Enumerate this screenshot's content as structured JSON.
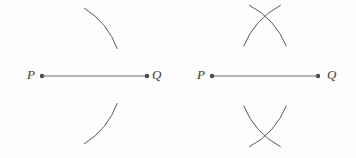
{
  "canvas": {
    "width": 356,
    "height": 158,
    "background_color": "#fdfdfd"
  },
  "style": {
    "stroke_color": "#5a5a5a",
    "segment_color": "#6b6b6b",
    "dot_color": "#4a4a4a",
    "label_color": "#3b3b3b",
    "stroke_width": 1,
    "dot_radius": 2.2
  },
  "figures": [
    {
      "id": "figure-left",
      "name": "segment-with-two-arcs",
      "segment": {
        "label_start": "P",
        "label_end": "Q",
        "x1": 42,
        "y1": 76,
        "x2": 147,
        "y2": 76
      },
      "points": [
        {
          "label": "P",
          "x": 42,
          "y": 76
        },
        {
          "label": "Q",
          "x": 147,
          "y": 76
        }
      ],
      "arcs": [
        {
          "name": "upper-arc",
          "center_x": 42,
          "center_y": 76,
          "radius": 80,
          "start_angle_deg": -58,
          "end_angle_deg": -20
        },
        {
          "name": "lower-arc",
          "center_x": 42,
          "center_y": 76,
          "radius": 80,
          "start_angle_deg": 20,
          "end_angle_deg": 58
        }
      ]
    },
    {
      "id": "figure-right",
      "name": "segment-with-crossing-arc-pairs",
      "segment": {
        "label_start": "P",
        "label_end": "Q",
        "x1": 212,
        "y1": 76,
        "x2": 318,
        "y2": 76
      },
      "points": [
        {
          "label": "P",
          "x": 212,
          "y": 76
        },
        {
          "label": "Q",
          "x": 318,
          "y": 76
        }
      ],
      "arcs": [
        {
          "name": "upper-arc-from-p",
          "center_x": 212,
          "center_y": 76,
          "radius": 80,
          "start_angle_deg": -62,
          "end_angle_deg": -22
        },
        {
          "name": "upper-arc-from-q",
          "center_x": 318,
          "center_y": 76,
          "radius": 80,
          "start_angle_deg": -158,
          "end_angle_deg": -118
        },
        {
          "name": "lower-arc-from-p",
          "center_x": 212,
          "center_y": 76,
          "radius": 80,
          "start_angle_deg": 22,
          "end_angle_deg": 62
        },
        {
          "name": "lower-arc-from-q",
          "center_x": 318,
          "center_y": 76,
          "radius": 80,
          "start_angle_deg": 118,
          "end_angle_deg": 158
        }
      ]
    }
  ],
  "labels": {
    "left_p": "P",
    "left_q": "Q",
    "right_p": "P",
    "right_q": "Q"
  }
}
